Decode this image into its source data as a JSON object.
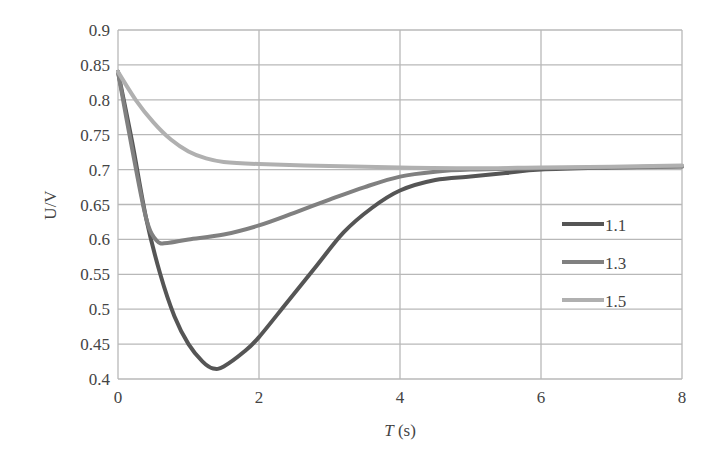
{
  "chart_data": {
    "type": "line",
    "title": "",
    "xlabel": "T (s)",
    "ylabel": "U/V",
    "xlim": [
      0,
      8
    ],
    "ylim": [
      0.4,
      0.9
    ],
    "xticks": [
      "0",
      "2",
      "4",
      "6",
      "8"
    ],
    "yticks": [
      "0.4",
      "0.45",
      "0.5",
      "0.55",
      "0.6",
      "0.65",
      "0.7",
      "0.75",
      "0.8",
      "0.85",
      "0.9"
    ],
    "grid": true,
    "legend_position": "right-center",
    "series": [
      {
        "name": "1.1",
        "color": "#555555",
        "x": [
          0,
          0.2,
          0.4,
          0.6,
          0.8,
          1.0,
          1.2,
          1.35,
          1.5,
          1.8,
          2.0,
          2.4,
          2.8,
          3.2,
          3.6,
          4.0,
          4.5,
          5.0,
          5.5,
          6.0,
          7.0,
          8.0
        ],
        "values": [
          0.84,
          0.74,
          0.63,
          0.55,
          0.49,
          0.45,
          0.425,
          0.415,
          0.418,
          0.44,
          0.46,
          0.51,
          0.56,
          0.61,
          0.645,
          0.67,
          0.685,
          0.69,
          0.695,
          0.7,
          0.703,
          0.705
        ]
      },
      {
        "name": "1.3",
        "color": "#808080",
        "x": [
          0,
          0.2,
          0.4,
          0.55,
          0.7,
          1.0,
          1.5,
          2.0,
          2.5,
          3.0,
          3.5,
          4.0,
          4.5,
          5.0,
          6.0,
          7.0,
          8.0
        ],
        "values": [
          0.84,
          0.73,
          0.63,
          0.598,
          0.595,
          0.6,
          0.607,
          0.62,
          0.638,
          0.657,
          0.675,
          0.69,
          0.697,
          0.7,
          0.702,
          0.703,
          0.704
        ]
      },
      {
        "name": "1.5",
        "color": "#b0b0b0",
        "x": [
          0,
          0.25,
          0.5,
          0.75,
          1.0,
          1.25,
          1.5,
          2.0,
          3.0,
          4.0,
          5.0,
          6.0,
          7.0,
          8.0
        ],
        "values": [
          0.84,
          0.8,
          0.768,
          0.743,
          0.726,
          0.716,
          0.711,
          0.708,
          0.705,
          0.703,
          0.702,
          0.703,
          0.704,
          0.706
        ]
      }
    ]
  }
}
